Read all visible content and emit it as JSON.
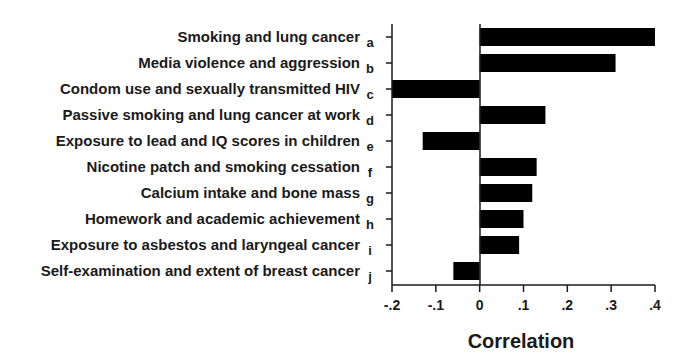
{
  "chart_data": {
    "type": "bar",
    "orientation": "horizontal",
    "title": "",
    "xlabel": "Correlation",
    "ylabel": "",
    "xlim": [
      -0.2,
      0.4
    ],
    "xticks": [
      -0.2,
      -0.1,
      0,
      0.1,
      0.2,
      0.3,
      0.4
    ],
    "xtick_labels": [
      "-.2",
      "-.1",
      "0",
      ".1",
      ".2",
      ".3",
      ".4"
    ],
    "grid": false,
    "legend": null,
    "bar_color": "#000000",
    "categories": [
      "Smoking and lung cancer",
      "Media violence and aggression",
      "Condom use and sexually transmitted HIV",
      "Passive smoking and lung cancer at work",
      "Exposure to lead and IQ scores in children",
      "Nicotine patch and smoking cessation",
      "Calcium intake and bone mass",
      "Homework and academic achievement",
      "Exposure to asbestos and laryngeal cancer",
      "Self-examination and extent of breast cancer"
    ],
    "letters": [
      "a",
      "b",
      "c",
      "d",
      "e",
      "f",
      "g",
      "h",
      "i",
      "j"
    ],
    "values": [
      0.4,
      0.31,
      -0.2,
      0.15,
      -0.13,
      0.13,
      0.12,
      0.1,
      0.09,
      -0.06
    ]
  }
}
